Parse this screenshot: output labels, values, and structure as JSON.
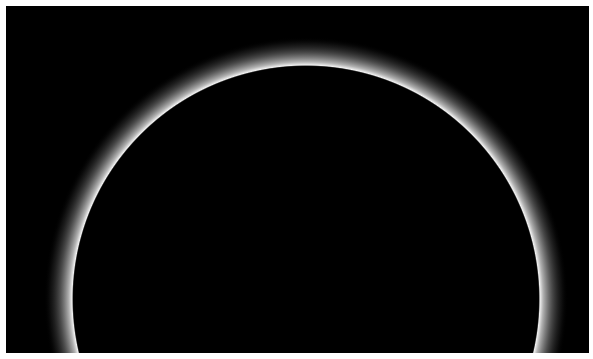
{
  "image": {
    "subject": "backlit planetary atmospheric haze ring",
    "background_color": "#000000",
    "ring_color": "#e8e8e8",
    "border_color": "#ffffff"
  }
}
